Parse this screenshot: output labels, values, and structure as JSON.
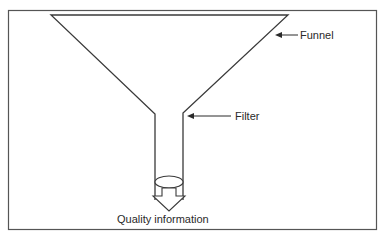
{
  "diagram": {
    "type": "funnel-metaphor",
    "labels": {
      "funnel": "Funnel",
      "filter": "Filter",
      "output": "Quality information"
    },
    "colors": {
      "stroke": "#3a3a3a",
      "frame": "#555555",
      "background": "#ffffff",
      "text": "#2a2a2a"
    }
  }
}
